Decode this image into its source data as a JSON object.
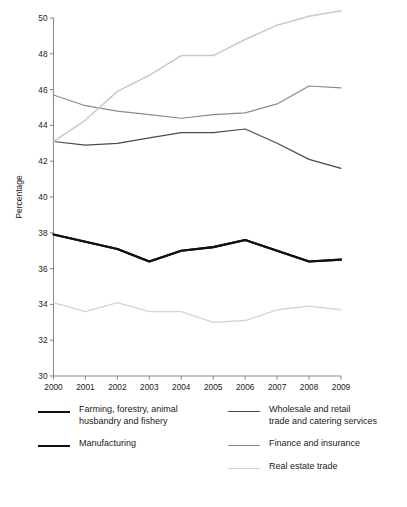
{
  "chart_data": {
    "type": "line",
    "title": "",
    "xlabel": "",
    "ylabel": "Percentage",
    "categories": [
      "2000",
      "2001",
      "2002",
      "2003",
      "2004",
      "2005",
      "2006",
      "2007",
      "2008",
      "2009"
    ],
    "x": [
      2000,
      2001,
      2002,
      2003,
      2004,
      2005,
      2006,
      2007,
      2008,
      2009
    ],
    "ylim": [
      30,
      50
    ],
    "ytick_labels": [
      "30",
      "32",
      "34",
      "36",
      "38",
      "40",
      "42",
      "44",
      "46",
      "48",
      "50"
    ],
    "ytick_values": [
      30,
      32,
      34,
      36,
      38,
      40,
      42,
      44,
      46,
      48,
      50
    ],
    "grid": false,
    "legend_position": "bottom",
    "series": [
      {
        "name": "Farming, forestry, animal husbandry and fishery",
        "color": "#111111",
        "width": 2.1,
        "values": [
          37.9,
          37.5,
          37.1,
          36.4,
          37.0,
          37.2,
          37.6,
          37.0,
          36.4,
          36.5
        ]
      },
      {
        "name": "Manufacturing",
        "color": "#111111",
        "width": 2.1,
        "values": [
          37.9,
          37.5,
          37.1,
          36.4,
          37.0,
          37.2,
          37.6,
          37.0,
          36.4,
          36.5
        ]
      },
      {
        "name": "Wholesale and retail trade and catering services",
        "color": "#4a4a4a",
        "width": 1.2,
        "values": [
          43.1,
          42.9,
          43.0,
          43.3,
          43.6,
          43.6,
          43.8,
          43.0,
          42.1,
          41.6
        ]
      },
      {
        "name": "Finance and insurance",
        "color": "#8a8a8a",
        "width": 1.2,
        "values": [
          45.7,
          45.1,
          44.8,
          44.6,
          44.4,
          44.6,
          44.7,
          45.2,
          46.2,
          46.1
        ]
      },
      {
        "name": "Real estate trade",
        "color": "#d5d5d5",
        "width": 1.3,
        "values": [
          34.1,
          33.6,
          34.1,
          33.6,
          33.6,
          33.0,
          33.1,
          33.7,
          33.9,
          33.7
        ]
      },
      {
        "name": "Real estate trade (upper)",
        "color": "#c9c9c9",
        "width": 1.5,
        "values": [
          43.1,
          44.3,
          45.9,
          46.8,
          47.9,
          47.9,
          48.8,
          49.6,
          50.1,
          50.4
        ]
      }
    ],
    "legend": {
      "left_column": [
        {
          "label": "Farming, forestry, animal\nhusbandry and fishery",
          "color": "#111111",
          "width": 2.1
        },
        {
          "label": "Manufacturing",
          "color": "#111111",
          "width": 2.1
        }
      ],
      "right_column": [
        {
          "label": "Wholesale and retail\ntrade and catering services",
          "color": "#4a4a4a",
          "width": 1.8
        },
        {
          "label": "Finance and insurance",
          "color": "#8a8a8a",
          "width": 1.4
        },
        {
          "label": "Real estate trade",
          "color": "#d2d2d2",
          "width": 1.4
        }
      ]
    }
  }
}
